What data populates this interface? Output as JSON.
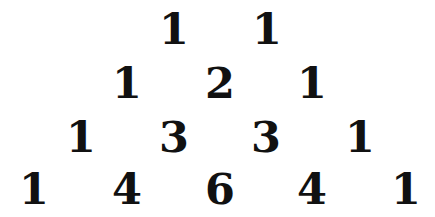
{
  "text_color": "#111111",
  "background_color": "#ffffff",
  "rows": [
    {
      "values": [
        "1",
        "1"
      ]
    },
    {
      "values": [
        "1",
        "2",
        "1"
      ]
    },
    {
      "values": [
        "1",
        "3",
        "3",
        "1"
      ]
    },
    {
      "values": [
        "1",
        "4",
        "6",
        "4",
        "1"
      ]
    }
  ]
}
